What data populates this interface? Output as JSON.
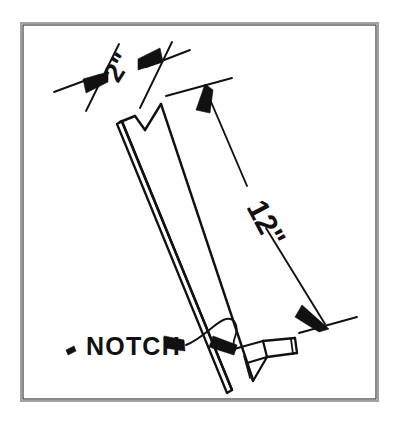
{
  "figure": {
    "type": "technical-drawing",
    "background_color": "#ffffff",
    "ink_color": "#111111",
    "frame_color": "#8a8a8a",
    "frame": {
      "x": 20,
      "y": 22,
      "width": 358,
      "height": 379
    }
  },
  "annotations": {
    "width_dimension": {
      "name": "width-dimension",
      "value": "2\"",
      "rotation_deg": -58,
      "text_x": 118,
      "text_y": 84,
      "font_size": 27
    },
    "length_dimension": {
      "name": "length-dimension",
      "value": "12\"",
      "rotation_deg": 62,
      "text_x": 246,
      "text_y": 207,
      "font_size": 30
    },
    "notch_callout": {
      "name": "notch-callout",
      "value": "NOTCH",
      "text_x": 86,
      "text_y": 352,
      "font_size": 25
    }
  },
  "geometry": {
    "board": {
      "face_outline": "M 122,121 L 134,116 L 143,128 L 160,104 L 252,381 L 232,389 Z",
      "edge_strip_outer": "M 118,124 L 122,121 L 232,389 L 228,392 Z",
      "edge_strip_inner": "M 121,128 L 235,390",
      "top_v_left": "M 122,121 L 134,116",
      "top_v_mid": "M 134,116 L 143,128",
      "top_v_right": "M 143,128 L 160,104",
      "spine_long": "M 160,104 L 252,381",
      "bottom_tip_a": "M 232,389 L 252,381",
      "notch_cut_top": "M 233,349 L 262,341",
      "notch_cut_step": "M 262,341 L 266,356",
      "notch_cut_back": "M 266,356 L 246,362",
      "notch_tip_a": "M 246,362 L 252,381",
      "notch_tip_b": "M 252,381 L 266,356",
      "notch_block_top": "M 262,341 L 294,338",
      "notch_block_side": "M 294,338 L 296,352",
      "notch_block_bottom": "M 296,352 L 266,356",
      "notch_block_edge": "M 291,340 L 293,353"
    },
    "dimension_lines": {
      "width_ext_left": "M 86,109 L 118,45",
      "width_ext_right": "M 139,107 L 171,43",
      "width_line_left": "M 56,91 L 104,73",
      "width_line_right": "M 188,51 L 142,69",
      "length_ext_top": "M 167,95 L 230,79",
      "length_ext_bottom": "M 300,332 L 356,318",
      "length_line": "M 204,87 L 327,325"
    },
    "arrowheads": {
      "width_left": {
        "points": "104,73 84,81 86,92 106,80",
        "direction": "right"
      },
      "width_right": {
        "points": "142,69 162,61 160,50 140,62",
        "direction": "left"
      },
      "length_top": {
        "points": "204,87 196,110 208,112 212,92",
        "direction": "up-left"
      },
      "length_bottom": {
        "points": "327,325 303,306 297,318 318,331",
        "direction": "down-right"
      },
      "notch_pointer": {
        "points": "185,342 166,336 167,346 186,350",
        "direction": "left"
      },
      "notch_target": {
        "points": "236,348 214,338 211,348 233,354",
        "direction": "left"
      }
    },
    "leader_line": {
      "notch_leader": "M 186,346 C 206,338 218,320 226,318 C 234,317 238,326 234,336 C 232,342 232,346 234,349",
      "notch_tail_dot": "M 68,349 l 6,-3 l 2,4 l -6,3 z"
    }
  }
}
